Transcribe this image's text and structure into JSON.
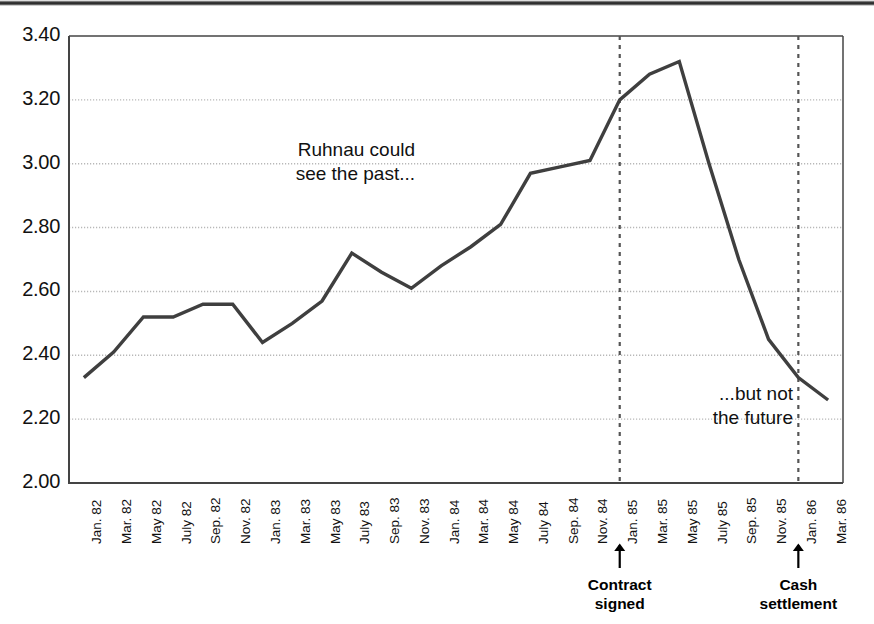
{
  "chart_data": {
    "type": "line",
    "title": "",
    "xlabel": "",
    "ylabel": "",
    "ylim": [
      2.0,
      3.4
    ],
    "ytick_step": 0.2,
    "yticks": [
      "2.00",
      "2.20",
      "2.40",
      "2.60",
      "2.80",
      "3.00",
      "3.20",
      "3.40"
    ],
    "grid": "horizontal-dotted",
    "legend": "none",
    "categories": [
      "Jan. 82",
      "Mar. 82",
      "May 82",
      "July 82",
      "Sep. 82",
      "Nov. 82",
      "Jan. 83",
      "Mar. 83",
      "May 83",
      "July 83",
      "Sep. 83",
      "Nov. 83",
      "Jan. 84",
      "Mar. 84",
      "May 84",
      "July 84",
      "Sep. 84",
      "Nov. 84",
      "Jan. 85",
      "Mar. 85",
      "May 85",
      "July 85",
      "Sep. 85",
      "Nov. 85",
      "Jan. 86",
      "Mar. 86"
    ],
    "values": [
      2.33,
      2.41,
      2.52,
      2.52,
      2.56,
      2.56,
      2.44,
      2.5,
      2.57,
      2.72,
      2.66,
      2.61,
      2.68,
      2.74,
      2.81,
      2.97,
      2.99,
      3.01,
      3.2,
      3.28,
      3.32,
      3.0,
      2.7,
      2.45,
      2.33,
      2.26
    ],
    "annotations": [
      {
        "id": "past-note",
        "text": "Ruhnau could\nsee the past...",
        "align": "right"
      },
      {
        "id": "future-note",
        "text": "...but not\nthe future",
        "align": "right"
      }
    ],
    "event_markers": [
      {
        "id": "contract-signed",
        "label": "Contract\nsigned",
        "at": "Jan. 85"
      },
      {
        "id": "cash-settlement",
        "label": "Cash\nsettlement",
        "at": "Jan. 86"
      }
    ],
    "colors": {
      "line": "#3f3f3f",
      "axis": "#444444",
      "gridline": "#b8b8b8",
      "event_line": "#555555",
      "text": "#111111",
      "background": "#ffffff"
    }
  }
}
